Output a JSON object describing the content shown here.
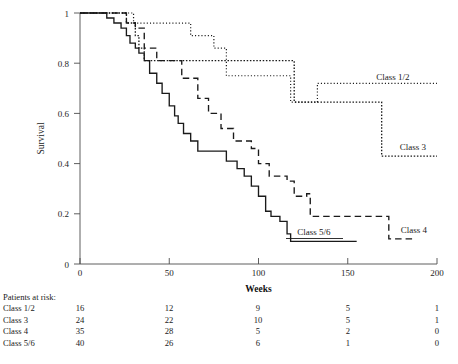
{
  "chart_data": {
    "type": "line",
    "title": "",
    "xlabel": "Weeks",
    "ylabel": "Survival",
    "xlim": [
      0,
      200
    ],
    "ylim": [
      0,
      1
    ],
    "xticks": [
      0,
      50,
      100,
      150,
      200
    ],
    "xtick_labels": [
      "0",
      "50",
      "100",
      "150",
      "200"
    ],
    "yticks": [
      0,
      0.2,
      0.4,
      0.6,
      0.8,
      1
    ],
    "ytick_labels": [
      "0",
      "0.2",
      "0.4",
      "0.6",
      "0.8",
      "1"
    ],
    "grid": false,
    "legend_position": "inline-right",
    "series": [
      {
        "name": "Class 1/2",
        "style": "fine-dotted",
        "label": "Class 1/2",
        "steps": [
          [
            0,
            1.0
          ],
          [
            30,
            1.0
          ],
          [
            30,
            0.96
          ],
          [
            62,
            0.96
          ],
          [
            62,
            0.91
          ],
          [
            75,
            0.91
          ],
          [
            75,
            0.86
          ],
          [
            82,
            0.86
          ],
          [
            82,
            0.75
          ],
          [
            118,
            0.75
          ],
          [
            118,
            0.645
          ],
          [
            133,
            0.645
          ],
          [
            133,
            0.72
          ],
          [
            200,
            0.72
          ]
        ],
        "points": [
          {
            "week": 0,
            "survival": 1.0
          },
          {
            "week": 30,
            "survival": 0.96
          },
          {
            "week": 62,
            "survival": 0.91
          },
          {
            "week": 75,
            "survival": 0.86
          },
          {
            "week": 82,
            "survival": 0.81
          },
          {
            "week": 133,
            "survival": 0.72
          },
          {
            "week": 200,
            "survival": 0.72
          }
        ]
      },
      {
        "name": "Class 3",
        "style": "dotted",
        "label": "Class 3",
        "points": [
          {
            "week": 0,
            "survival": 1.0
          },
          {
            "week": 20,
            "survival": 1.0
          },
          {
            "week": 26,
            "survival": 0.96
          },
          {
            "week": 31,
            "survival": 0.91
          },
          {
            "week": 33,
            "survival": 0.86
          },
          {
            "week": 36,
            "survival": 0.81
          },
          {
            "week": 118,
            "survival": 0.81
          },
          {
            "week": 120,
            "survival": 0.645
          },
          {
            "week": 167,
            "survival": 0.645
          },
          {
            "week": 169,
            "survival": 0.43
          },
          {
            "week": 200,
            "survival": 0.43
          }
        ]
      },
      {
        "name": "Class 4",
        "style": "dashed",
        "label": "Class 4",
        "points": [
          {
            "week": 0,
            "survival": 1.0
          },
          {
            "week": 22,
            "survival": 1.0
          },
          {
            "week": 26,
            "survival": 0.96
          },
          {
            "week": 31,
            "survival": 0.94
          },
          {
            "week": 36,
            "survival": 0.86
          },
          {
            "week": 43,
            "survival": 0.81
          },
          {
            "week": 57,
            "survival": 0.74
          },
          {
            "week": 66,
            "survival": 0.66
          },
          {
            "week": 72,
            "survival": 0.6
          },
          {
            "week": 79,
            "survival": 0.54
          },
          {
            "week": 86,
            "survival": 0.49
          },
          {
            "week": 96,
            "survival": 0.46
          },
          {
            "week": 100,
            "survival": 0.4
          },
          {
            "week": 106,
            "survival": 0.35
          },
          {
            "week": 116,
            "survival": 0.33
          },
          {
            "week": 120,
            "survival": 0.27
          },
          {
            "week": 127,
            "survival": 0.28
          },
          {
            "week": 129,
            "survival": 0.19
          },
          {
            "week": 170,
            "survival": 0.19
          },
          {
            "week": 173,
            "survival": 0.1
          },
          {
            "week": 187,
            "survival": 0.1
          }
        ]
      },
      {
        "name": "Class 5/6",
        "style": "solid",
        "label": "Class 5/6",
        "points": [
          {
            "week": 0,
            "survival": 1.0
          },
          {
            "week": 12,
            "survival": 1.0
          },
          {
            "week": 15,
            "survival": 0.98
          },
          {
            "week": 19,
            "survival": 0.96
          },
          {
            "week": 23,
            "survival": 0.94
          },
          {
            "week": 26,
            "survival": 0.91
          },
          {
            "week": 28,
            "survival": 0.88
          },
          {
            "week": 31,
            "survival": 0.86
          },
          {
            "week": 33,
            "survival": 0.84
          },
          {
            "week": 36,
            "survival": 0.81
          },
          {
            "week": 39,
            "survival": 0.76
          },
          {
            "week": 43,
            "survival": 0.72
          },
          {
            "week": 46,
            "survival": 0.68
          },
          {
            "week": 50,
            "survival": 0.63
          },
          {
            "week": 53,
            "survival": 0.59
          },
          {
            "week": 55,
            "survival": 0.56
          },
          {
            "week": 58,
            "survival": 0.52
          },
          {
            "week": 62,
            "survival": 0.49
          },
          {
            "week": 66,
            "survival": 0.45
          },
          {
            "week": 79,
            "survival": 0.45
          },
          {
            "week": 82,
            "survival": 0.41
          },
          {
            "week": 88,
            "survival": 0.38
          },
          {
            "week": 92,
            "survival": 0.35
          },
          {
            "week": 96,
            "survival": 0.31
          },
          {
            "week": 100,
            "survival": 0.27
          },
          {
            "week": 104,
            "survival": 0.21
          },
          {
            "week": 107,
            "survival": 0.19
          },
          {
            "week": 112,
            "survival": 0.17
          },
          {
            "week": 116,
            "survival": 0.12
          },
          {
            "week": 118,
            "survival": 0.09
          },
          {
            "week": 155,
            "survival": 0.09
          }
        ]
      }
    ]
  },
  "risk_table": {
    "heading": "Patients at risk:",
    "columns": [
      0,
      50,
      100,
      150,
      200
    ],
    "rows": [
      {
        "name": "Class 1/2",
        "values": [
          "16",
          "12",
          "9",
          "5",
          "1"
        ]
      },
      {
        "name": "Class 3",
        "values": [
          "24",
          "22",
          "10",
          "5",
          "1"
        ]
      },
      {
        "name": "Class 4",
        "values": [
          "35",
          "28",
          "5",
          "2",
          "0"
        ]
      },
      {
        "name": "Class 5/6",
        "values": [
          "40",
          "26",
          "6",
          "1",
          "0"
        ]
      }
    ]
  },
  "colors": {
    "ink": "#1a1a1a",
    "axis": "#4d4d4d",
    "background": "#ffffff"
  }
}
